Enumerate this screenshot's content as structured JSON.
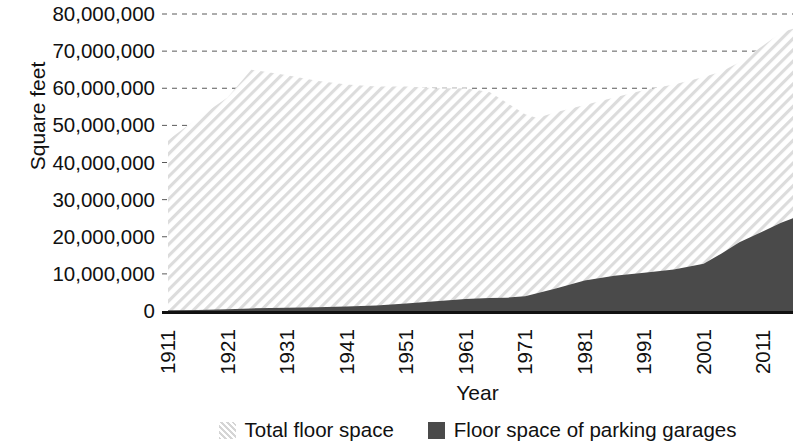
{
  "chart_data": {
    "type": "area",
    "title": "",
    "xlabel": "Year",
    "ylabel": "Square feet",
    "xlim": [
      1911,
      2016
    ],
    "ylim": [
      0,
      80000000
    ],
    "grid": true,
    "stacked": false,
    "legend_position": "bottom",
    "y_ticks": [
      0,
      10000000,
      20000000,
      30000000,
      40000000,
      50000000,
      60000000,
      70000000,
      80000000
    ],
    "y_tick_labels": [
      "0",
      "10,000,000",
      "20,000,000",
      "30,000,000",
      "40,000,000",
      "50,000,000",
      "60,000,000",
      "70,000,000",
      "80,000,000"
    ],
    "x_ticks": [
      1911,
      1921,
      1931,
      1941,
      1951,
      1961,
      1971,
      1981,
      1991,
      2001,
      2011
    ],
    "x_tick_labels": [
      "1911",
      "1921",
      "1931",
      "1941",
      "1951",
      "1961",
      "1971",
      "1981",
      "1991",
      "2001",
      "2011"
    ],
    "x": [
      1911,
      1916,
      1921,
      1925,
      1931,
      1936,
      1941,
      1946,
      1951,
      1956,
      1961,
      1965,
      1968,
      1971,
      1973,
      1976,
      1981,
      1986,
      1991,
      1996,
      2001,
      2004,
      2007,
      2011,
      2014,
      2016
    ],
    "series": [
      {
        "name": "Total floor space",
        "fill": "hatched",
        "color": "#d5d5d5",
        "values": [
          46000000,
          52000000,
          57500000,
          65000000,
          63500000,
          62000000,
          61000000,
          60500000,
          60500000,
          60000000,
          60000000,
          59000000,
          56000000,
          53000000,
          52000000,
          53500000,
          55500000,
          57500000,
          59500000,
          61000000,
          63000000,
          64500000,
          67000000,
          71500000,
          75000000,
          76000000
        ]
      },
      {
        "name": "Floor space of parking garages",
        "fill": "solid",
        "color": "#4a4a4a",
        "values": [
          200000,
          300000,
          500000,
          700000,
          900000,
          1000000,
          1200000,
          1500000,
          2000000,
          2600000,
          3200000,
          3500000,
          3600000,
          4000000,
          4800000,
          6000000,
          8200000,
          9500000,
          10300000,
          11200000,
          12700000,
          15500000,
          18500000,
          21500000,
          23800000,
          25000000
        ]
      }
    ]
  },
  "axis": {
    "y_title": "Square feet",
    "x_title": "Year"
  },
  "legend": {
    "items": [
      {
        "label": "Total floor space",
        "swatch": "hatched-swatch"
      },
      {
        "label": "Floor space of parking garages",
        "swatch": "solid-swatch"
      }
    ]
  }
}
